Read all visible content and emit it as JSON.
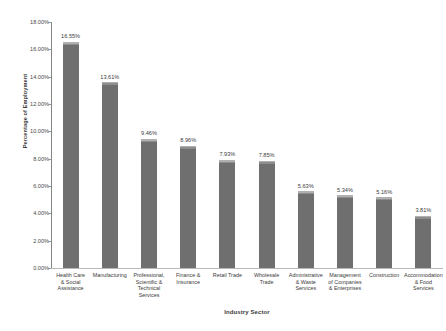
{
  "chart_data": {
    "type": "bar",
    "title": "",
    "xlabel": "Industry Sector",
    "ylabel": "Percentage of Employment",
    "ylim": [
      0,
      18
    ],
    "ytick_labels": [
      "18.00%",
      "16.00%",
      "14.00%",
      "12.00%",
      "10.00%",
      "8.00%",
      "6.00%",
      "4.00%",
      "2.00%",
      "0.00%"
    ],
    "ytick_values": [
      18,
      16,
      14,
      12,
      10,
      8,
      6,
      4,
      2,
      0
    ],
    "grid": false,
    "legend": "none",
    "categories": [
      "Health Care & Social Assistance",
      "Manufacturing",
      "Professional, Scientific & Technical Services",
      "Finance & Insurance",
      "Retail Trade",
      "Wholesale Trade",
      "Administrative & Waste Services",
      "Management of Companies & Enterprises",
      "Construction",
      "Accommodation & Food Services"
    ],
    "category_lines": [
      [
        "Health Care",
        "& Social",
        "Assistance"
      ],
      [
        "Manufacturing"
      ],
      [
        "Professional,",
        "Scientific &",
        "Technical",
        "Services"
      ],
      [
        "Finance &",
        "Insurance"
      ],
      [
        "Retail Trade"
      ],
      [
        "Wholesale",
        "Trade"
      ],
      [
        "Administrative",
        "& Waste",
        "Services"
      ],
      [
        "Management",
        "of Companies",
        "& Enterprises"
      ],
      [
        "Construction"
      ],
      [
        "Accommodation",
        "& Food",
        "Services"
      ]
    ],
    "values": [
      16.55,
      13.61,
      9.46,
      8.96,
      7.93,
      7.85,
      5.63,
      5.34,
      5.16,
      3.81
    ],
    "value_labels": [
      "16.55%",
      "13.61%",
      "9.46%",
      "8.96%",
      "7.93%",
      "7.85%",
      "5.63%",
      "5.34%",
      "5.16%",
      "3.81%"
    ],
    "bar_color": "#6f6f6f",
    "bar_highlight_color": "#b0b0b0",
    "axis_color": "#868686",
    "background_color": "#ffffff"
  }
}
